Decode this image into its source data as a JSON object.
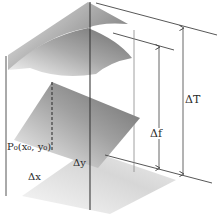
{
  "figure": {
    "type": "3d-surface-increment-diagram",
    "labels": {
      "delta_T": "ΔT",
      "delta_f": "Δf",
      "point": "P₀(x₀, y₀)",
      "delta_x": "Δx",
      "delta_y": "Δy"
    },
    "surfaces": [
      {
        "name": "surface-top",
        "shape": "curved",
        "shade": "gradient-gray"
      },
      {
        "name": "tangent-plane",
        "shape": "curved",
        "shade": "gradient-gray"
      },
      {
        "name": "middle-plane",
        "shape": "flat",
        "shade": "gradient-gray"
      },
      {
        "name": "base-plane-xy",
        "shape": "flat",
        "shade": "light-gray"
      }
    ],
    "arrows": [
      {
        "name": "delta-T-arrow",
        "label": "ΔT",
        "direction": "vertical-both"
      },
      {
        "name": "delta-f-arrow",
        "label": "Δf",
        "direction": "vertical-both"
      }
    ],
    "colors": {
      "line": "#3a3a3a",
      "surface_dark": "#8a8a8a",
      "surface_light": "#f0f0f0",
      "background": "#ffffff"
    }
  }
}
